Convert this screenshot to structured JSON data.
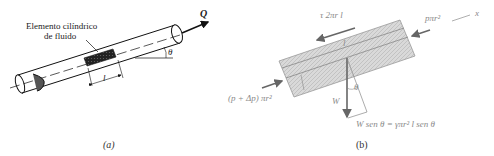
{
  "panel_a": {
    "element_label_line1": "Elemento cilíndrico",
    "element_label_line2": "de fluido",
    "flow_label": "Q",
    "angle_label": "θ",
    "length_label": "l",
    "caption": "(a)"
  },
  "panel_b": {
    "shear_force": "τ 2πr l",
    "right_pressure_force": "pπr²",
    "axis_label": "x",
    "left_pressure_force": "(p + Δp) πr²",
    "length_label": "l",
    "angle_label": "θ",
    "weight_label": "W",
    "weight_component": "W sen θ = γπr² l sen θ",
    "caption": "(b)"
  }
}
